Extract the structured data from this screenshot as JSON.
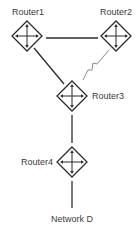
{
  "diagram": {
    "type": "network-topology",
    "nodes": [
      {
        "id": "router1",
        "label": "Router1",
        "kind": "router",
        "cx": 27,
        "cy": 36
      },
      {
        "id": "router2",
        "label": "Router2",
        "kind": "router",
        "cx": 116,
        "cy": 36
      },
      {
        "id": "router3",
        "label": "Router3",
        "kind": "router",
        "cx": 72,
        "cy": 96
      },
      {
        "id": "router4",
        "label": "Router4",
        "kind": "router",
        "cx": 72,
        "cy": 162
      },
      {
        "id": "network-d",
        "label": "Network D",
        "kind": "network"
      }
    ],
    "links": [
      {
        "from": "Router1",
        "to": "Router2",
        "kind": "ethernet"
      },
      {
        "from": "Router1",
        "to": "Router3",
        "kind": "ethernet"
      },
      {
        "from": "Router2",
        "to": "Router3",
        "kind": "serial"
      },
      {
        "from": "Router3",
        "to": "Router4",
        "kind": "ethernet"
      },
      {
        "from": "Router4",
        "to": "Network D",
        "kind": "ethernet"
      }
    ]
  },
  "labels": {
    "router1": "Router1",
    "router2": "Router2",
    "router3": "Router3",
    "router4": "Router4",
    "network_d": "Network D"
  },
  "icons": {
    "router": "router-diamond-icon",
    "serial_link": "lightning-bolt-icon"
  },
  "colors": {
    "line": "#2b2b2b",
    "serial_line": "#8a8a8a",
    "text": "#3a3a3a",
    "background": "#ffffff"
  }
}
